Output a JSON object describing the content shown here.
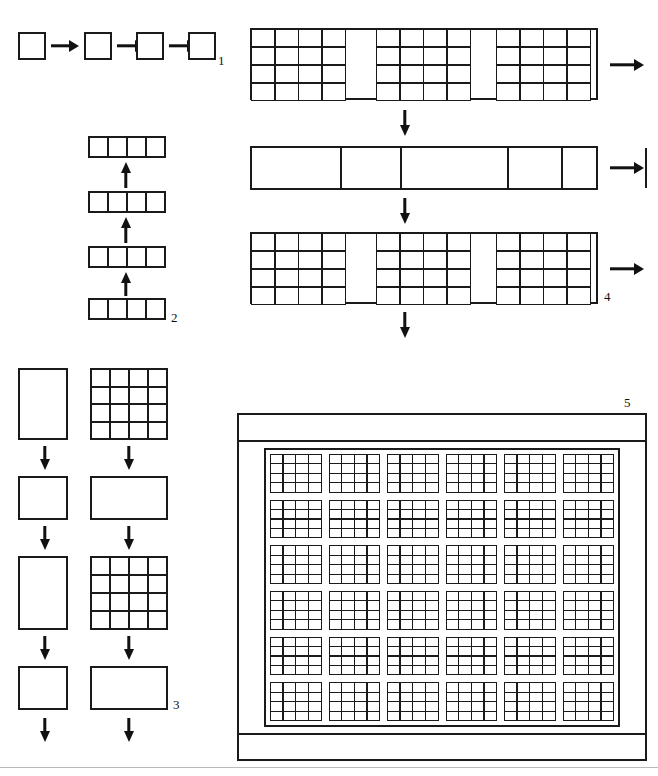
{
  "figure": {
    "background_color": "#ffffff",
    "ink_color": "#1a1a1a",
    "panel_labels": [
      "1",
      "2",
      "3",
      "4",
      "5"
    ]
  },
  "panels": [
    {
      "id": "panel-1",
      "label": "1",
      "description": "Four single squares connected left-to-right by arrows",
      "orientation": "horizontal",
      "arrow_direction": "right",
      "node_count": 4,
      "node_type": "single-square",
      "node_subdivisions": 1
    },
    {
      "id": "panel-2",
      "label": "2",
      "description": "Four horizontal strips of four cells, chained upward by arrows",
      "orientation": "vertical",
      "arrow_direction": "up",
      "node_count": 4,
      "node_type": "strip-of-4-cells",
      "cells_per_strip": 4
    },
    {
      "id": "panel-3",
      "label": "3",
      "description": "Two parallel alternating chains: left column alternates tall rectangle and square; right column alternates 4x4 grid and wide rectangle",
      "orientation": "vertical",
      "arrow_direction": "down",
      "columns": [
        {
          "name": "left-chain",
          "steps": [
            "tall-rectangle",
            "square",
            "tall-rectangle",
            "square"
          ],
          "arrows": 4
        },
        {
          "name": "right-chain",
          "steps": [
            "grid-4x4",
            "wide-rectangle",
            "grid-4x4",
            "wide-rectangle"
          ],
          "arrows": 4
        }
      ]
    },
    {
      "id": "panel-4",
      "label": "4",
      "description": "Three wide bars chained downward; outer arrows point right at each stage",
      "orientation": "vertical",
      "arrow_direction": "down",
      "side_arrow_direction": "right",
      "rows": [
        {
          "name": "row-1",
          "type": "banded-grid",
          "blocks": 3,
          "block_rows": 4,
          "block_cols": 4,
          "gutters": 2
        },
        {
          "name": "row-2",
          "type": "plain-segments",
          "segments": 6,
          "segment_widths": [
            88,
            58,
            105,
            52,
            82,
            48
          ]
        },
        {
          "name": "row-3",
          "type": "banded-grid",
          "blocks": 3,
          "block_rows": 4,
          "block_cols": 4,
          "gutters": 2
        }
      ]
    },
    {
      "id": "panel-5",
      "label": "5",
      "description": "Framed field containing a 6 by 6 arrangement of 4 by 4 sub-grid blocks, self-similar nesting",
      "frame": {
        "has_top_band": true,
        "has_bottom_band": true,
        "has_side_margins": true
      },
      "field_rows": 6,
      "field_cols": 6,
      "block_rows": 4,
      "block_cols": 4,
      "total_cells": 576
    }
  ],
  "footer": {
    "rule_visible": true
  }
}
